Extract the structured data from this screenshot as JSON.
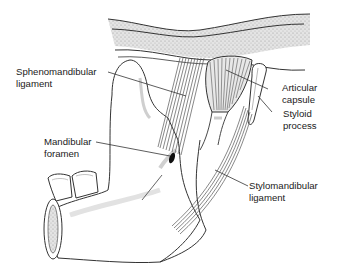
{
  "diagram": {
    "labels": [
      {
        "id": "sphenomandibular",
        "line1": "Sphenomandibular",
        "line2": "ligament"
      },
      {
        "id": "articular",
        "line1": "Articular",
        "line2": "capsule"
      },
      {
        "id": "styloid",
        "line1": "Styloid",
        "line2": "process"
      },
      {
        "id": "mandibular_foramen",
        "line1": "Mandibular",
        "line2": "foramen"
      },
      {
        "id": "stylomandibular",
        "line1": "Stylomandibular",
        "line2": "ligament"
      }
    ],
    "colors": {
      "outline": "#333333",
      "bone_fill": "#ffffff",
      "skull_base_fill": "#d8d8d8",
      "fiber": "#555555",
      "text": "#1a1a1a",
      "leader": "#333333"
    }
  }
}
